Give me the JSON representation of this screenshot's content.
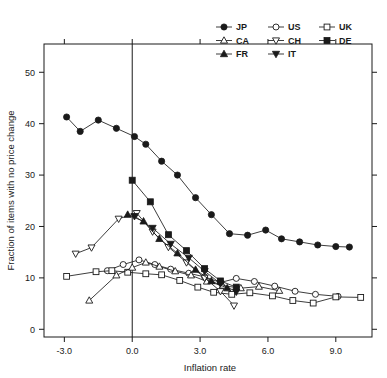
{
  "chart_data": {
    "type": "line",
    "title": "",
    "xlabel": "Inflation rate",
    "ylabel": "Fraction of items with no price change",
    "xlim": [
      -3.9,
      10.6
    ],
    "ylim": [
      -1.5,
      55.5
    ],
    "xticks": [
      -3.0,
      0.0,
      3.0,
      6.0,
      9.0
    ],
    "xticklabels": [
      "-3.0",
      "0.0",
      "3.0",
      "6.0",
      "9.0"
    ],
    "yticks": [
      0,
      10,
      20,
      30,
      40,
      50
    ],
    "yticklabels": [
      "0",
      "10",
      "20",
      "30",
      "40",
      "50"
    ],
    "grid": false,
    "legend_position": "top-right",
    "reference_lines": [
      {
        "axis": "x",
        "value": 0.0
      }
    ],
    "series": [
      {
        "name": "JP",
        "marker": "filled-circle",
        "x": [
          -2.9,
          -2.3,
          -1.5,
          -0.7,
          0.1,
          0.6,
          1.3,
          2.0,
          2.8,
          3.5,
          4.3,
          5.1,
          5.9,
          6.6,
          7.4,
          8.2,
          9.0,
          9.6
        ],
        "y": [
          41.3,
          38.5,
          40.7,
          39.1,
          37.5,
          36.0,
          32.7,
          30.0,
          25.6,
          22.3,
          18.6,
          18.3,
          19.3,
          17.6,
          17.0,
          16.4,
          16.1,
          16.0
        ]
      },
      {
        "name": "US",
        "marker": "open-circle",
        "x": [
          -1.1,
          -0.4,
          0.3,
          1.0,
          1.7,
          2.5,
          3.2,
          3.9,
          4.6,
          5.4,
          6.3,
          7.2,
          8.1,
          9.1
        ],
        "y": [
          11.4,
          12.6,
          13.5,
          12.6,
          11.7,
          10.9,
          10.2,
          9.1,
          9.9,
          9.3,
          8.4,
          7.4,
          6.8,
          6.4
        ]
      },
      {
        "name": "UK",
        "marker": "open-square",
        "x": [
          -2.9,
          -1.6,
          -0.9,
          -0.2,
          0.6,
          1.3,
          2.1,
          2.9,
          3.6,
          4.4,
          5.2,
          6.2,
          7.1,
          8.0,
          9.0,
          10.1
        ],
        "y": [
          10.3,
          11.2,
          11.4,
          11.1,
          10.8,
          10.6,
          9.5,
          8.2,
          7.2,
          6.8,
          7.1,
          6.5,
          5.6,
          5.1,
          6.3,
          6.2
        ]
      },
      {
        "name": "CA",
        "marker": "open-triangle-up",
        "x": [
          -1.9,
          -0.7,
          0.0,
          0.6,
          1.2,
          1.9,
          2.6,
          3.3,
          4.0,
          4.8,
          5.6,
          6.5
        ],
        "y": [
          5.6,
          10.5,
          12.0,
          13.0,
          12.2,
          11.3,
          10.5,
          9.3,
          8.5,
          8.0,
          8.3,
          7.5
        ]
      },
      {
        "name": "CH",
        "marker": "open-triangle-down",
        "x": [
          -2.5,
          -1.8,
          -0.6,
          0.2,
          0.9,
          1.6,
          2.4,
          3.2,
          3.9,
          4.5
        ],
        "y": [
          14.7,
          15.9,
          21.5,
          22.6,
          19.0,
          16.0,
          13.0,
          10.0,
          7.4,
          4.6
        ]
      },
      {
        "name": "DE",
        "marker": "filled-square",
        "x": [
          0.0,
          0.8,
          1.6,
          2.4,
          3.2,
          3.9,
          4.6
        ],
        "y": [
          29.0,
          24.8,
          18.4,
          15.3,
          11.8,
          9.4,
          8.2
        ]
      },
      {
        "name": "FR",
        "marker": "filled-triangle-up",
        "x": [
          -0.2,
          0.5,
          1.2,
          2.0,
          2.8,
          3.5,
          4.2
        ],
        "y": [
          22.3,
          21.0,
          17.6,
          14.8,
          11.6,
          9.4,
          8.0
        ]
      },
      {
        "name": "IT",
        "marker": "filled-triangle-down",
        "x": [
          0.1,
          0.9,
          1.7,
          2.5,
          3.2,
          3.9,
          4.6
        ],
        "y": [
          22.0,
          19.7,
          16.6,
          13.9,
          11.3,
          8.9,
          7.3
        ]
      }
    ]
  },
  "legend": {
    "rows": [
      [
        {
          "name": "JP"
        },
        {
          "name": "US"
        },
        {
          "name": "UK"
        }
      ],
      [
        {
          "name": "CA"
        },
        {
          "name": "CH"
        },
        {
          "name": "DE"
        }
      ],
      [
        {
          "name": "FR"
        },
        {
          "name": "IT"
        }
      ]
    ]
  },
  "colors": {
    "axis": "#1a1a1a",
    "series": "#1a1a1a",
    "background": "#ffffff"
  }
}
